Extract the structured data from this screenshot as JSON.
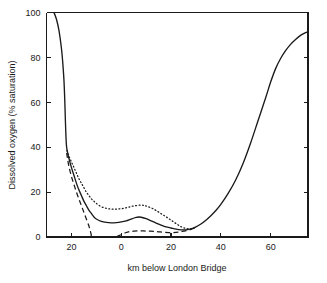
{
  "chart_data": {
    "type": "line",
    "title": "",
    "xlabel": "km below London Bridge",
    "ylabel": "Dissolved oxygen (% saturation)",
    "xlim": [
      -30,
      75
    ],
    "ylim": [
      0,
      100
    ],
    "xticks": [
      -20,
      0,
      20,
      40,
      60
    ],
    "xtick_labels": [
      "20",
      "0",
      "20",
      "40",
      "60"
    ],
    "yticks": [
      0,
      20,
      40,
      60,
      80,
      100
    ],
    "ytick_labels": [
      "0",
      "20",
      "40",
      "60",
      "80",
      "100"
    ],
    "grid": false,
    "legend": "none",
    "series": [
      {
        "name": "solid-curve",
        "style": "solid",
        "points": [
          [
            -27.0,
            100.0
          ],
          [
            -26.0,
            97.0
          ],
          [
            -25.0,
            92.0
          ],
          [
            -24.0,
            84.0
          ],
          [
            -23.5,
            78.0
          ],
          [
            -23.0,
            70.0
          ],
          [
            -22.7,
            62.0
          ],
          [
            -22.5,
            55.0
          ],
          [
            -22.3,
            48.0
          ],
          [
            -22.0,
            41.0
          ],
          [
            -21.6,
            38.0
          ],
          [
            -21.0,
            35.0
          ],
          [
            -20.0,
            31.0
          ],
          [
            -19.0,
            27.5
          ],
          [
            -18.0,
            24.0
          ],
          [
            -17.0,
            21.0
          ],
          [
            -16.0,
            18.5
          ],
          [
            -15.0,
            16.0
          ],
          [
            -14.0,
            14.0
          ],
          [
            -13.0,
            12.0
          ],
          [
            -12.0,
            10.5
          ],
          [
            -11.0,
            9.0
          ],
          [
            -10.0,
            8.0
          ],
          [
            -8.0,
            7.0
          ],
          [
            -6.0,
            6.5
          ],
          [
            -4.0,
            6.3
          ],
          [
            -2.0,
            6.4
          ],
          [
            0.0,
            6.7
          ],
          [
            2.0,
            7.2
          ],
          [
            4.0,
            8.0
          ],
          [
            6.0,
            8.7
          ],
          [
            7.0,
            8.9
          ],
          [
            8.0,
            8.8
          ],
          [
            10.0,
            8.2
          ],
          [
            12.0,
            7.2
          ],
          [
            14.0,
            6.2
          ],
          [
            16.0,
            5.3
          ],
          [
            18.0,
            4.5
          ],
          [
            20.0,
            4.0
          ],
          [
            22.0,
            3.5
          ],
          [
            24.0,
            3.2
          ],
          [
            26.0,
            3.2
          ],
          [
            28.0,
            3.6
          ],
          [
            30.0,
            4.5
          ],
          [
            32.0,
            5.8
          ],
          [
            34.0,
            7.5
          ],
          [
            36.0,
            9.5
          ],
          [
            38.0,
            11.8
          ],
          [
            40.0,
            14.5
          ],
          [
            43.0,
            19.5
          ],
          [
            46.0,
            25.5
          ],
          [
            49.0,
            33.0
          ],
          [
            52.0,
            42.0
          ],
          [
            55.0,
            52.0
          ],
          [
            58.0,
            62.0
          ],
          [
            60.0,
            69.0
          ],
          [
            62.0,
            75.0
          ],
          [
            64.0,
            79.5
          ],
          [
            66.0,
            83.0
          ],
          [
            68.0,
            85.8
          ],
          [
            70.0,
            88.0
          ],
          [
            72.0,
            89.8
          ],
          [
            74.0,
            91.0
          ],
          [
            75.0,
            91.5
          ]
        ]
      },
      {
        "name": "dotted-curve",
        "style": "dotted",
        "points": [
          [
            -21.8,
            38.5
          ],
          [
            -21.0,
            36.0
          ],
          [
            -20.0,
            33.5
          ],
          [
            -19.0,
            31.0
          ],
          [
            -18.0,
            28.5
          ],
          [
            -17.0,
            26.0
          ],
          [
            -16.0,
            24.0
          ],
          [
            -15.0,
            22.0
          ],
          [
            -14.0,
            20.0
          ],
          [
            -13.0,
            18.5
          ],
          [
            -12.0,
            17.0
          ],
          [
            -11.0,
            16.0
          ],
          [
            -10.0,
            15.0
          ],
          [
            -8.0,
            13.5
          ],
          [
            -6.0,
            12.8
          ],
          [
            -4.0,
            12.4
          ],
          [
            -2.0,
            12.4
          ],
          [
            0.0,
            12.6
          ],
          [
            2.0,
            13.0
          ],
          [
            4.0,
            13.6
          ],
          [
            6.0,
            14.0
          ],
          [
            8.0,
            14.2
          ],
          [
            9.0,
            14.1
          ],
          [
            10.0,
            13.8
          ],
          [
            12.0,
            13.0
          ],
          [
            14.0,
            11.8
          ],
          [
            16.0,
            10.4
          ],
          [
            18.0,
            9.0
          ],
          [
            20.0,
            7.5
          ],
          [
            22.0,
            6.0
          ],
          [
            24.0,
            4.6
          ],
          [
            26.0,
            3.8
          ],
          [
            28.0,
            3.6
          ],
          [
            30.0,
            4.4
          ]
        ]
      },
      {
        "name": "dashed-curve",
        "style": "dashed",
        "points": [
          [
            -21.9,
            37.5
          ],
          [
            -21.5,
            34.5
          ],
          [
            -21.0,
            31.5
          ],
          [
            -20.0,
            27.0
          ],
          [
            -19.0,
            23.5
          ],
          [
            -18.0,
            20.0
          ],
          [
            -17.0,
            17.0
          ],
          [
            -16.0,
            14.0
          ],
          [
            -15.0,
            11.0
          ],
          [
            -14.0,
            8.0
          ],
          [
            -13.0,
            5.0
          ],
          [
            -12.5,
            3.0
          ],
          [
            -12.0,
            1.0
          ],
          [
            -11.7,
            0.0
          ],
          [
            -3.0,
            0.0
          ],
          [
            -2.0,
            0.2
          ],
          [
            -1.0,
            0.6
          ],
          [
            0.0,
            1.0
          ],
          [
            1.0,
            1.5
          ],
          [
            2.0,
            2.0
          ],
          [
            3.5,
            2.4
          ],
          [
            5.0,
            2.6
          ],
          [
            7.0,
            2.7
          ],
          [
            9.0,
            2.7
          ],
          [
            11.0,
            2.6
          ],
          [
            13.0,
            2.5
          ],
          [
            15.0,
            2.3
          ],
          [
            17.0,
            2.1
          ],
          [
            19.0,
            2.0
          ],
          [
            21.0,
            2.0
          ],
          [
            23.0,
            2.2
          ],
          [
            25.0,
            2.6
          ],
          [
            27.0,
            3.0
          ],
          [
            29.0,
            3.8
          ],
          [
            30.0,
            4.4
          ]
        ]
      }
    ]
  },
  "axes": {
    "xlabel": "km below London Bridge",
    "ylabel": "Dissolved oxygen (% saturation)"
  }
}
